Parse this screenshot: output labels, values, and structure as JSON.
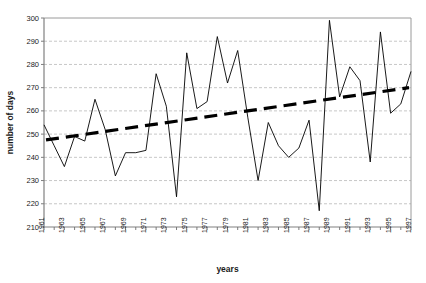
{
  "chart_data": {
    "type": "line",
    "title": "",
    "xlabel": "years",
    "ylabel": "number of days",
    "ylim": [
      210,
      300
    ],
    "ytick_step": 10,
    "yticks": [
      210,
      220,
      230,
      240,
      250,
      260,
      270,
      280,
      290,
      300
    ],
    "grid": true,
    "legend": "none",
    "xlim": [
      1961,
      1997
    ],
    "x": [
      1961,
      1962,
      1963,
      1964,
      1965,
      1966,
      1967,
      1968,
      1969,
      1970,
      1971,
      1972,
      1973,
      1974,
      1975,
      1976,
      1977,
      1978,
      1979,
      1980,
      1981,
      1982,
      1983,
      1984,
      1985,
      1986,
      1987,
      1988,
      1989,
      1990,
      1991,
      1992,
      1993,
      1994,
      1995,
      1996,
      1997
    ],
    "xtick_labels": [
      "1961",
      "1963",
      "1965",
      "1967",
      "1969",
      "1971",
      "1973",
      "1975",
      "1977",
      "1979",
      "1981",
      "1983",
      "1985",
      "1987",
      "1989",
      "1991",
      "1993",
      "1995",
      "1997"
    ],
    "xtick_label_interval": 2,
    "series": [
      {
        "name": "number of days",
        "style": "thin-solid-line",
        "color": "#000000",
        "values": [
          254,
          245,
          236,
          249,
          247,
          265,
          252,
          232,
          242,
          242,
          243,
          276,
          262,
          223,
          285,
          261,
          264,
          292,
          272,
          286,
          257,
          230,
          255,
          245,
          240,
          244,
          256,
          217,
          299,
          266,
          279,
          273,
          238,
          294,
          259,
          263,
          277
        ]
      },
      {
        "name": "linear trend",
        "style": "thick-dashed-line",
        "color": "#000000",
        "start_value": 247.5,
        "end_value": 270.0
      }
    ]
  },
  "axes": {
    "y_title": "number of days",
    "x_title": "years"
  }
}
